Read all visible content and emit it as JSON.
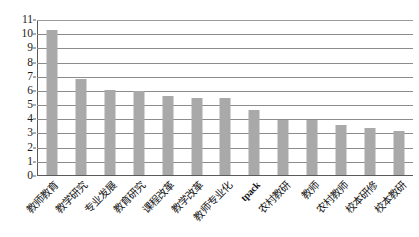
{
  "chart_data": {
    "type": "bar",
    "title": "",
    "subtitle": "",
    "xlabel": "",
    "ylabel": "",
    "ylim": [
      0,
      11
    ],
    "ytick_step": 1,
    "grid": true,
    "legend": false,
    "bar_color": "#a9a9a9",
    "gridline_color": "#8c8c8c",
    "axis_color": "#5a5a5a",
    "categories": [
      "教师教育",
      "教学研究",
      "专业发展",
      "教育研究",
      "课程改革",
      "教学改革",
      "教师专业化",
      "tpack",
      "农村教研",
      "教师",
      "农村教师",
      "校本研修",
      "校本教研"
    ],
    "values": [
      10.2,
      6.75,
      6.0,
      5.9,
      5.55,
      5.45,
      5.45,
      4.6,
      3.85,
      3.85,
      3.5,
      3.3,
      3.1
    ],
    "ytick_labels": [
      "11",
      "10",
      "9",
      "8",
      "7",
      "6",
      "5",
      "4",
      "3",
      "2",
      "1",
      "0"
    ],
    "ytick_values": [
      11,
      10,
      9,
      8,
      7,
      6,
      5,
      4,
      3,
      2,
      1,
      0
    ]
  }
}
